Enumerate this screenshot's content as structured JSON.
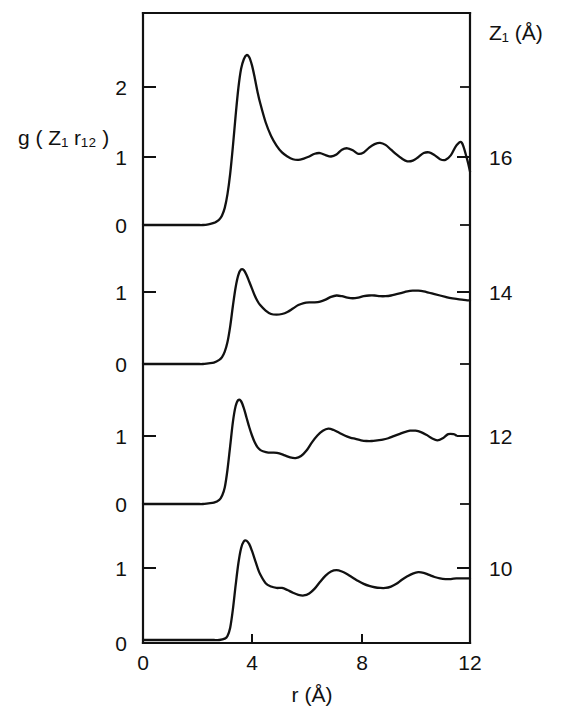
{
  "chart_data": {
    "type": "line",
    "title": "",
    "xlabel": "r (Å)",
    "ylabel": "g ( Z₁ r₁₂ )",
    "y2label": "Z₁ (Å)",
    "xlim": [
      0,
      12
    ],
    "xticks": [
      0,
      4,
      8,
      12
    ],
    "xticklabels": [
      "0",
      "4",
      "8",
      "12"
    ],
    "grid": false,
    "legend": "none",
    "stacked_offset_panels": true,
    "panel_yticklabels": [
      "2",
      "1",
      "0"
    ],
    "right_axis_ticks": [
      16,
      14,
      12,
      10
    ],
    "right_axis_ticklabels": [
      "16",
      "14",
      "12",
      "10"
    ],
    "series": [
      {
        "name": "Z1 = 16",
        "z_label": "16",
        "baseline_value": 1,
        "yticks": [
          0,
          1,
          2
        ],
        "x": [
          0.0,
          0.2,
          0.4,
          0.6,
          0.8,
          1.0,
          1.2,
          1.4,
          1.6,
          1.8,
          2.0,
          2.2,
          2.4,
          2.6,
          2.7,
          2.8,
          2.9,
          3.0,
          3.1,
          3.2,
          3.3,
          3.4,
          3.5,
          3.6,
          3.7,
          3.8,
          3.9,
          4.0,
          4.1,
          4.2,
          4.3,
          4.5,
          4.7,
          4.9,
          5.1,
          5.3,
          5.5,
          5.7,
          5.9,
          6.1,
          6.3,
          6.5,
          6.7,
          6.9,
          7.1,
          7.3,
          7.5,
          7.7,
          7.9,
          8.1,
          8.3,
          8.5,
          8.7,
          8.9,
          9.1,
          9.3,
          9.5,
          9.7,
          9.9,
          10.1,
          10.3,
          10.5,
          10.7,
          10.9,
          11.1,
          11.3,
          11.5,
          11.7,
          11.9,
          12.0
        ],
        "y": [
          0.0,
          0.0,
          0.0,
          0.0,
          0.0,
          0.0,
          0.0,
          0.0,
          0.0,
          0.0,
          0.0,
          0.0,
          0.01,
          0.03,
          0.05,
          0.08,
          0.14,
          0.25,
          0.45,
          0.75,
          1.15,
          1.6,
          2.0,
          2.28,
          2.42,
          2.48,
          2.45,
          2.33,
          2.15,
          1.95,
          1.78,
          1.5,
          1.3,
          1.16,
          1.06,
          1.0,
          0.96,
          0.95,
          0.97,
          1.0,
          1.04,
          1.05,
          1.02,
          1.0,
          1.03,
          1.1,
          1.12,
          1.09,
          1.04,
          1.06,
          1.13,
          1.18,
          1.2,
          1.17,
          1.1,
          1.03,
          0.97,
          0.93,
          0.94,
          0.99,
          1.05,
          1.06,
          1.02,
          0.96,
          0.95,
          1.02,
          1.16,
          1.2,
          0.95,
          0.78
        ]
      },
      {
        "name": "Z1 = 14",
        "z_label": "14",
        "baseline_value": 1,
        "yticks": [
          0,
          1
        ],
        "x": [
          0.0,
          0.2,
          0.4,
          0.6,
          0.8,
          1.0,
          1.2,
          1.4,
          1.6,
          1.8,
          2.0,
          2.2,
          2.4,
          2.6,
          2.8,
          2.9,
          3.0,
          3.1,
          3.2,
          3.3,
          3.4,
          3.5,
          3.6,
          3.7,
          3.8,
          3.9,
          4.0,
          4.1,
          4.2,
          4.3,
          4.5,
          4.7,
          4.9,
          5.1,
          5.3,
          5.5,
          5.7,
          5.9,
          6.1,
          6.3,
          6.5,
          6.7,
          6.9,
          7.1,
          7.3,
          7.5,
          7.7,
          7.9,
          8.1,
          8.3,
          8.5,
          8.7,
          8.9,
          9.1,
          9.3,
          9.5,
          9.7,
          9.9,
          10.1,
          10.3,
          10.5,
          10.7,
          10.9,
          11.1,
          11.3,
          11.5,
          11.7,
          11.9,
          12.0
        ],
        "y": [
          0.0,
          0.0,
          0.0,
          0.0,
          0.0,
          0.0,
          0.0,
          0.0,
          0.0,
          0.0,
          0.0,
          0.0,
          0.01,
          0.02,
          0.06,
          0.1,
          0.18,
          0.32,
          0.55,
          0.85,
          1.12,
          1.3,
          1.38,
          1.37,
          1.3,
          1.2,
          1.1,
          1.0,
          0.92,
          0.86,
          0.78,
          0.73,
          0.72,
          0.73,
          0.76,
          0.81,
          0.86,
          0.89,
          0.9,
          0.9,
          0.91,
          0.94,
          0.98,
          1.0,
          0.99,
          0.97,
          0.96,
          0.97,
          0.99,
          1.0,
          1.0,
          0.99,
          0.99,
          1.0,
          1.02,
          1.04,
          1.06,
          1.07,
          1.07,
          1.06,
          1.04,
          1.02,
          1.0,
          0.98,
          0.96,
          0.95,
          0.94,
          0.93,
          0.93
        ]
      },
      {
        "name": "Z1 = 12",
        "z_label": "12",
        "baseline_value": 1,
        "yticks": [
          0,
          1
        ],
        "x": [
          0.0,
          0.2,
          0.4,
          0.6,
          0.8,
          1.0,
          1.2,
          1.4,
          1.6,
          1.8,
          2.0,
          2.2,
          2.4,
          2.6,
          2.8,
          2.9,
          3.0,
          3.1,
          3.2,
          3.3,
          3.4,
          3.5,
          3.6,
          3.7,
          3.8,
          3.9,
          4.0,
          4.1,
          4.2,
          4.3,
          4.4,
          4.6,
          4.8,
          5.0,
          5.2,
          5.4,
          5.6,
          5.8,
          6.0,
          6.2,
          6.4,
          6.6,
          6.8,
          7.0,
          7.2,
          7.4,
          7.6,
          7.8,
          8.0,
          8.2,
          8.4,
          8.6,
          8.8,
          9.0,
          9.2,
          9.4,
          9.6,
          9.8,
          10.0,
          10.2,
          10.4,
          10.6,
          10.8,
          11.0,
          11.2,
          11.4,
          11.5
        ],
        "y": [
          0.0,
          0.0,
          0.0,
          0.0,
          0.0,
          0.0,
          0.0,
          0.0,
          0.0,
          0.0,
          0.0,
          0.0,
          0.01,
          0.02,
          0.06,
          0.12,
          0.24,
          0.5,
          0.85,
          1.2,
          1.43,
          1.52,
          1.5,
          1.4,
          1.26,
          1.12,
          1.0,
          0.9,
          0.83,
          0.79,
          0.77,
          0.75,
          0.75,
          0.74,
          0.71,
          0.68,
          0.67,
          0.7,
          0.78,
          0.9,
          1.0,
          1.07,
          1.1,
          1.08,
          1.04,
          1.0,
          0.97,
          0.95,
          0.93,
          0.92,
          0.92,
          0.93,
          0.94,
          0.96,
          0.99,
          1.02,
          1.05,
          1.07,
          1.07,
          1.05,
          1.01,
          0.96,
          0.93,
          0.96,
          1.02,
          1.02,
          1.0
        ]
      },
      {
        "name": "Z1 = 10",
        "z_label": "10",
        "baseline_value": 1,
        "yticks": [
          0,
          1
        ],
        "x": [
          0.0,
          0.2,
          0.4,
          0.6,
          0.8,
          1.0,
          1.2,
          1.4,
          1.6,
          1.8,
          2.0,
          2.2,
          2.4,
          2.6,
          2.8,
          3.0,
          3.1,
          3.2,
          3.3,
          3.4,
          3.5,
          3.6,
          3.7,
          3.8,
          3.9,
          4.0,
          4.1,
          4.2,
          4.3,
          4.5,
          4.7,
          4.9,
          5.1,
          5.3,
          5.5,
          5.7,
          5.9,
          6.1,
          6.3,
          6.5,
          6.7,
          6.9,
          7.1,
          7.3,
          7.5,
          7.7,
          7.9,
          8.1,
          8.3,
          8.5,
          8.7,
          8.9,
          9.1,
          9.3,
          9.5,
          9.7,
          9.9,
          10.1,
          10.3,
          10.5,
          10.7,
          10.9,
          11.1,
          11.3,
          11.5,
          11.7,
          11.9,
          12.0
        ],
        "y": [
          0.0,
          0.0,
          0.0,
          0.0,
          0.0,
          0.0,
          0.0,
          0.0,
          0.0,
          0.0,
          0.0,
          0.0,
          0.0,
          0.0,
          0.0,
          0.02,
          0.06,
          0.18,
          0.45,
          0.8,
          1.12,
          1.34,
          1.44,
          1.45,
          1.4,
          1.3,
          1.18,
          1.06,
          0.96,
          0.83,
          0.78,
          0.76,
          0.76,
          0.73,
          0.69,
          0.66,
          0.65,
          0.68,
          0.75,
          0.85,
          0.94,
          1.0,
          1.02,
          1.0,
          0.96,
          0.91,
          0.86,
          0.82,
          0.79,
          0.77,
          0.76,
          0.76,
          0.78,
          0.82,
          0.88,
          0.93,
          0.97,
          0.99,
          0.98,
          0.95,
          0.92,
          0.9,
          0.89,
          0.89,
          0.9,
          0.9,
          0.9,
          0.9
        ]
      }
    ]
  },
  "axes": {
    "left_panel_labels": [
      {
        "value": "2"
      },
      {
        "value": "1"
      },
      {
        "value": "0"
      },
      {
        "value": "1"
      },
      {
        "value": "0"
      },
      {
        "value": "1"
      },
      {
        "value": "0"
      },
      {
        "value": "1"
      },
      {
        "value": "0"
      }
    ]
  }
}
